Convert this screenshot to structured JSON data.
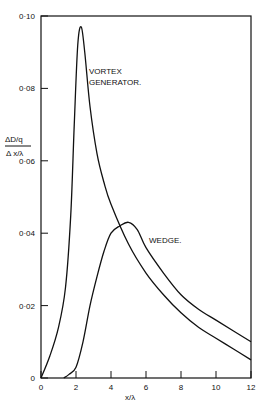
{
  "chart_data": {
    "type": "line",
    "title": "",
    "xlabel": "x/λ",
    "ylabel": "ΔD/q / Δx/λ",
    "xlim": [
      0,
      12
    ],
    "ylim": [
      0,
      0.1
    ],
    "x_ticks": [
      "0",
      "2",
      "4",
      "6",
      "8",
      "10",
      "12"
    ],
    "y_ticks": [
      "0",
      "0·02",
      "0·04",
      "0·06",
      "0·08",
      "0·10"
    ],
    "grid": false,
    "legend": "inline labels",
    "series": [
      {
        "name": "VORTEX GENERATOR.",
        "x": [
          0,
          0.5,
          1.0,
          1.4,
          1.7,
          1.9,
          2.1,
          2.3,
          2.5,
          2.8,
          3.2,
          3.6,
          4,
          5,
          6,
          7,
          8,
          9,
          10,
          11,
          12
        ],
        "y": [
          0,
          0.006,
          0.014,
          0.025,
          0.045,
          0.07,
          0.092,
          0.097,
          0.09,
          0.075,
          0.062,
          0.054,
          0.048,
          0.037,
          0.029,
          0.023,
          0.018,
          0.014,
          0.011,
          0.008,
          0.005
        ]
      },
      {
        "name": "WEDGE.",
        "x": [
          1.3,
          1.6,
          2.0,
          2.4,
          2.8,
          3.2,
          3.6,
          4.0,
          4.5,
          5.0,
          5.5,
          6,
          7,
          8,
          9,
          10,
          11,
          12
        ],
        "y": [
          0,
          0.001,
          0.003,
          0.01,
          0.02,
          0.028,
          0.035,
          0.04,
          0.042,
          0.043,
          0.041,
          0.036,
          0.029,
          0.023,
          0.019,
          0.016,
          0.013,
          0.01
        ]
      }
    ],
    "annotations": [
      "VORTEX GENERATOR.",
      "WEDGE."
    ]
  },
  "labels": {
    "y_num": "ΔD/q",
    "y_den": "Δ x/λ",
    "x": "x/λ",
    "vortex": [
      "VORTEX",
      "GENERATOR."
    ],
    "wedge": "WEDGE."
  }
}
